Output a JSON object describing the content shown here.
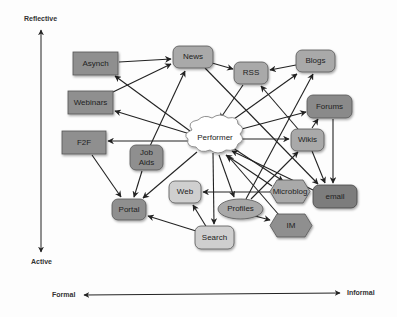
{
  "axes": {
    "vertical": {
      "top": "Reflective",
      "bottom": "Active"
    },
    "horizontal": {
      "left": "Formal",
      "right": "Informal"
    }
  },
  "colors": {
    "dark": "#8f8f8f",
    "medium": "#a9a9a9",
    "light": "#cfcfcf",
    "darkest": "#7d7d7d",
    "cloud": "#ffffff",
    "edge": "#222222"
  },
  "nodes": {
    "asynch": "Asynch",
    "news": "News",
    "rss": "RSS",
    "blogs": "Blogs",
    "webinars": "Webinars",
    "forums": "Forums",
    "f2f": "F2F",
    "performer": "Performer",
    "wikis": "Wikis",
    "jobaids_1": "Job",
    "jobaids_2": "Aids",
    "web": "Web",
    "microblog": "Microblog",
    "email": "email",
    "portal": "Portal",
    "profiles": "Profiles",
    "im": "IM",
    "search": "Search"
  },
  "edges": [
    [
      "Asynch",
      "News"
    ],
    [
      "Webinars",
      "News"
    ],
    [
      "News",
      "RSS"
    ],
    [
      "Blogs",
      "RSS"
    ],
    [
      "Performer",
      "Asynch"
    ],
    [
      "Performer",
      "Webinars"
    ],
    [
      "Performer",
      "F2F"
    ],
    [
      "Job Aids",
      "News"
    ],
    [
      "RSS",
      "Performer"
    ],
    [
      "Performer",
      "Blogs"
    ],
    [
      "Performer",
      "Forums"
    ],
    [
      "Performer",
      "Wikis"
    ],
    [
      "Wikis",
      "Forums"
    ],
    [
      "Wikis",
      "RSS"
    ],
    [
      "News",
      "email"
    ],
    [
      "Forums",
      "email"
    ],
    [
      "Wikis",
      "email"
    ],
    [
      "F2F",
      "Portal"
    ],
    [
      "Job Aids",
      "Portal"
    ],
    [
      "Performer",
      "Portal"
    ],
    [
      "Search",
      "Portal"
    ],
    [
      "Search",
      "Web"
    ],
    [
      "Performer",
      "Search"
    ],
    [
      "Microblog",
      "Web"
    ],
    [
      "Performer",
      "Profiles"
    ],
    [
      "Profiles",
      "IM"
    ],
    [
      "Profiles",
      "Blogs"
    ],
    [
      "Profiles",
      "Wikis"
    ],
    [
      "Microblog",
      "Performer"
    ],
    [
      "email",
      "Performer"
    ],
    [
      "IM",
      "Performer"
    ],
    [
      "Performer",
      "Microblog"
    ]
  ]
}
